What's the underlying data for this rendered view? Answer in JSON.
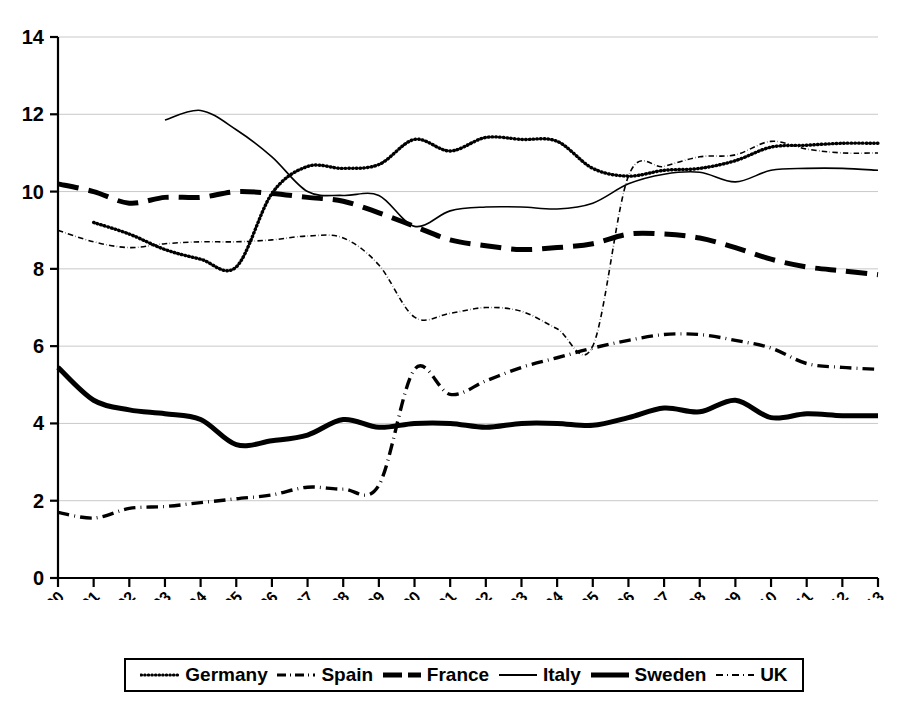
{
  "chart_data": {
    "type": "line",
    "title": "",
    "subtitle": "",
    "xlabel": "",
    "ylabel": "",
    "xlim": [
      1990,
      2013
    ],
    "ylim": [
      0,
      14
    ],
    "ytick_step": 2,
    "yticks": [
      "0",
      "2",
      "4",
      "6",
      "8",
      "10",
      "12",
      "14"
    ],
    "grid": true,
    "grid_axis": "y",
    "legend_position": "bottom",
    "x": [
      1990,
      1991,
      1992,
      1993,
      1994,
      1995,
      1996,
      1997,
      1998,
      1999,
      2000,
      2001,
      2002,
      2003,
      2004,
      2005,
      2006,
      2007,
      2008,
      2009,
      2010,
      2011,
      2012,
      2013
    ],
    "categories": [
      "1990",
      "1991",
      "1992",
      "1993",
      "1994",
      "1995",
      "1996",
      "1997",
      "1998",
      "1999",
      "2000",
      "2001",
      "2002",
      "2003",
      "2004",
      "2005",
      "2006",
      "2007",
      "2008",
      "2009",
      "2010",
      "2011",
      "2012",
      "2013"
    ],
    "series": [
      {
        "name": "Germany",
        "style": "dotted",
        "width": 3.4,
        "color": "#000000",
        "values": [
          null,
          9.2,
          8.9,
          8.5,
          8.25,
          8.05,
          9.95,
          10.65,
          10.6,
          10.7,
          11.35,
          11.05,
          11.4,
          11.35,
          11.3,
          10.6,
          10.4,
          10.55,
          10.6,
          10.8,
          11.15,
          11.2,
          11.25,
          11.25
        ]
      },
      {
        "name": "Spain",
        "style": "dashdot",
        "width": 3.4,
        "color": "#000000",
        "values": [
          1.7,
          1.55,
          1.8,
          1.85,
          1.95,
          2.05,
          2.15,
          2.35,
          2.3,
          2.4,
          5.4,
          4.75,
          5.1,
          5.45,
          5.7,
          5.95,
          6.15,
          6.3,
          6.3,
          6.15,
          5.95,
          5.55,
          5.45,
          5.4
        ]
      },
      {
        "name": "France",
        "style": "dashed",
        "width": 5.0,
        "color": "#000000",
        "values": [
          10.2,
          10.0,
          9.7,
          9.85,
          9.85,
          10.0,
          9.95,
          9.85,
          9.75,
          9.45,
          9.1,
          8.75,
          8.6,
          8.5,
          8.55,
          8.65,
          8.9,
          8.9,
          8.8,
          8.55,
          8.25,
          8.05,
          7.95,
          7.85
        ]
      },
      {
        "name": "Italy",
        "style": "solid",
        "width": 1.6,
        "color": "#000000",
        "values": [
          null,
          null,
          null,
          11.85,
          12.1,
          11.6,
          10.9,
          10.0,
          9.9,
          9.9,
          9.1,
          9.5,
          9.6,
          9.6,
          9.55,
          9.7,
          10.2,
          10.45,
          10.5,
          10.25,
          10.55,
          10.6,
          10.6,
          10.55
        ]
      },
      {
        "name": "Sweden",
        "style": "solid",
        "width": 5.0,
        "color": "#000000",
        "values": [
          5.45,
          4.6,
          4.35,
          4.25,
          4.1,
          3.45,
          3.55,
          3.7,
          4.1,
          3.9,
          4.0,
          4.0,
          3.9,
          4.0,
          4.0,
          3.95,
          4.15,
          4.4,
          4.3,
          4.6,
          4.15,
          4.25,
          4.2,
          4.2
        ]
      },
      {
        "name": "UK",
        "style": "dashdot",
        "width": 1.6,
        "color": "#000000",
        "values": [
          9.0,
          8.7,
          8.55,
          8.65,
          8.7,
          8.7,
          8.75,
          8.85,
          8.8,
          8.1,
          6.75,
          6.85,
          7.0,
          6.9,
          6.45,
          6.0,
          10.4,
          10.65,
          10.9,
          10.95,
          11.3,
          11.1,
          11.0,
          11.0
        ]
      }
    ],
    "annotations": [
      {
        "text": "UK series break between 2005 and 2006 shown as near-vertical segment"
      }
    ]
  },
  "legend": {
    "items": [
      {
        "label": "Germany",
        "style": "dotted"
      },
      {
        "label": "Spain",
        "style": "dashdot"
      },
      {
        "label": "France",
        "style": "dashed"
      },
      {
        "label": "Italy",
        "style": "solid-thin"
      },
      {
        "label": "Sweden",
        "style": "solid-thick"
      },
      {
        "label": "UK",
        "style": "dashdot-thin"
      }
    ]
  }
}
